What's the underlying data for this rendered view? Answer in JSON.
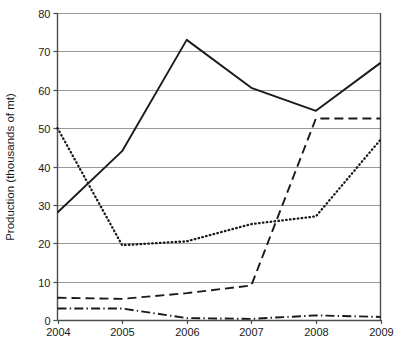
{
  "chart_data": {
    "type": "line",
    "title": "",
    "xlabel": "",
    "ylabel": "Production (thousands of mt)",
    "categories": [
      "2004",
      "2005",
      "2006",
      "2007",
      "2008",
      "2009"
    ],
    "x": [
      2004,
      2005,
      2006,
      2007,
      2008,
      2009
    ],
    "xlim": [
      2004,
      2009
    ],
    "ylim": [
      0,
      80
    ],
    "yticks": [
      0,
      10,
      20,
      30,
      40,
      50,
      60,
      70,
      80
    ],
    "ytick_labels": [
      "0",
      "10",
      "20",
      "30",
      "40",
      "50",
      "60",
      "70",
      "80"
    ],
    "xtick_labels": [
      "2004",
      "2005",
      "2006",
      "2007",
      "2008",
      "2009"
    ],
    "grid": "horizontal",
    "legend": "none",
    "series": [
      {
        "name": "series-solid",
        "style": "solid",
        "color": "#1a1a1a",
        "values": [
          28,
          44,
          73,
          60.5,
          54.5,
          67
        ]
      },
      {
        "name": "series-dotted",
        "style": "dotted",
        "color": "#1a1a1a",
        "values": [
          50,
          19.5,
          20.5,
          25,
          27,
          47
        ]
      },
      {
        "name": "series-dashed",
        "style": "dashed",
        "color": "#1a1a1a",
        "values": [
          5.8,
          5.5,
          7,
          9,
          52.5,
          52.5
        ]
      },
      {
        "name": "series-dash-dot",
        "style": "dashdot",
        "color": "#1a1a1a",
        "values": [
          3,
          3,
          0.5,
          0.3,
          1.2,
          0.8
        ]
      }
    ]
  },
  "axis": {
    "y_title": "Production (thousands of mt)",
    "y_labels": [
      "80",
      "70",
      "60",
      "50",
      "40",
      "30",
      "20",
      "10",
      "0"
    ],
    "x_labels": [
      "2004",
      "2005",
      "2006",
      "2007",
      "2008",
      "2009"
    ]
  },
  "colors": {
    "line": "#1a1a1a",
    "grid": "#8c8c8c",
    "axis": "#4d4d4d",
    "background": "#ffffff"
  }
}
